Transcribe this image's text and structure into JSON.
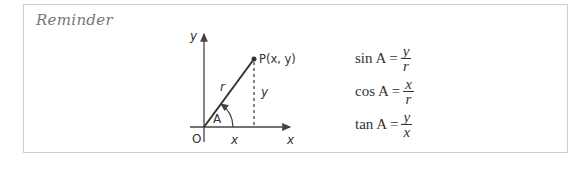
{
  "title": "Reminder",
  "diagram": {
    "y_axis_label": "y",
    "x_axis_label": "x",
    "origin_label": "O",
    "point_label": "P(x, y)",
    "hypotenuse_label": "r",
    "vertical_label": "y",
    "horizontal_label": "x",
    "angle_label": "A"
  },
  "formulas": [
    {
      "lhs": "sin A =",
      "numerator": "y",
      "denominator": "r"
    },
    {
      "lhs": "cos A =",
      "numerator": "x",
      "denominator": "r"
    },
    {
      "lhs": "tan A =",
      "numerator": "y",
      "denominator": "x"
    }
  ]
}
